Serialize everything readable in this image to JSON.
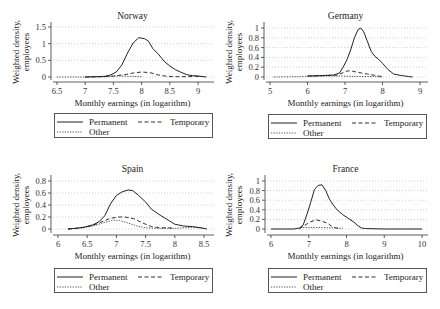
{
  "figure": {
    "layout": "2x2 grid of kernel density panels"
  },
  "chart_data": [
    {
      "type": "line",
      "title": "Norway",
      "xlabel": "Monthly earnings (in logarithm)",
      "ylabel": [
        "Weighted density,",
        "employees"
      ],
      "xticks": [
        6.5,
        7,
        7.5,
        8,
        8.5,
        9
      ],
      "xtick_labels": [
        "6.5",
        "7",
        "7.5",
        "8",
        "8.5",
        "9"
      ],
      "yticks": [
        0,
        0.5,
        1,
        1.5
      ],
      "ytick_labels": [
        "0",
        "0.5",
        "1",
        "1.5"
      ],
      "xlim": [
        6.4,
        9.27
      ],
      "ylim": [
        0,
        1.6
      ],
      "grid": true,
      "legend_position": "bottom",
      "series": [
        {
          "name": "Permanent",
          "style": "solid",
          "points": [
            [
              7.0,
              0
            ],
            [
              7.2,
              0.01
            ],
            [
              7.35,
              0.02
            ],
            [
              7.45,
              0.06
            ],
            [
              7.55,
              0.15
            ],
            [
              7.65,
              0.36
            ],
            [
              7.75,
              0.72
            ],
            [
              7.85,
              1.02
            ],
            [
              7.95,
              1.18
            ],
            [
              8.05,
              1.15
            ],
            [
              8.12,
              1.08
            ],
            [
              8.2,
              0.85
            ],
            [
              8.3,
              0.68
            ],
            [
              8.4,
              0.47
            ],
            [
              8.5,
              0.33
            ],
            [
              8.6,
              0.22
            ],
            [
              8.7,
              0.14
            ],
            [
              8.8,
              0.07
            ],
            [
              8.9,
              0.04
            ],
            [
              9.0,
              0.03
            ],
            [
              9.1,
              0.01
            ],
            [
              9.15,
              0
            ]
          ]
        },
        {
          "name": "Temporary",
          "style": "dash",
          "points": [
            [
              7.0,
              0
            ],
            [
              7.3,
              0.01
            ],
            [
              7.5,
              0.03
            ],
            [
              7.7,
              0.07
            ],
            [
              7.85,
              0.12
            ],
            [
              8.0,
              0.15
            ],
            [
              8.15,
              0.13
            ],
            [
              8.3,
              0.06
            ],
            [
              8.45,
              0.02
            ],
            [
              8.6,
              0.01
            ],
            [
              8.8,
              0.01
            ],
            [
              9.0,
              0.02
            ],
            [
              9.1,
              0.01
            ]
          ]
        },
        {
          "name": "Other",
          "style": "dot",
          "points": [
            [
              6.5,
              0
            ],
            [
              7.0,
              0
            ],
            [
              7.4,
              0.01
            ],
            [
              7.6,
              0.03
            ],
            [
              7.8,
              0.02
            ],
            [
              8.0,
              0.01
            ]
          ]
        }
      ]
    },
    {
      "type": "line",
      "title": "Germany",
      "xlabel": "Monthly earnings (in logarithm)",
      "ylabel": [
        "Weighted density,",
        "employees"
      ],
      "xticks": [
        5,
        6,
        7,
        8,
        9
      ],
      "xtick_labels": [
        "5",
        "6",
        "7",
        "8",
        "9"
      ],
      "yticks": [
        0,
        0.2,
        0.4,
        0.6,
        0.8,
        1
      ],
      "ytick_labels": [
        "0",
        "0.2",
        "0.4",
        "0.6",
        "0.8",
        "1"
      ],
      "xlim": [
        4.85,
        9.2
      ],
      "ylim": [
        0,
        1.05
      ],
      "grid": true,
      "legend_position": "bottom",
      "series": [
        {
          "name": "Permanent",
          "style": "solid",
          "points": [
            [
              6.0,
              0.02
            ],
            [
              6.4,
              0.03
            ],
            [
              6.7,
              0.04
            ],
            [
              6.85,
              0.08
            ],
            [
              6.95,
              0.2
            ],
            [
              7.05,
              0.35
            ],
            [
              7.15,
              0.55
            ],
            [
              7.25,
              0.8
            ],
            [
              7.35,
              0.97
            ],
            [
              7.42,
              1.0
            ],
            [
              7.5,
              0.92
            ],
            [
              7.6,
              0.72
            ],
            [
              7.7,
              0.52
            ],
            [
              7.8,
              0.42
            ],
            [
              7.9,
              0.36
            ],
            [
              8.0,
              0.28
            ],
            [
              8.15,
              0.15
            ],
            [
              8.3,
              0.06
            ],
            [
              8.5,
              0.03
            ],
            [
              8.7,
              0.01
            ],
            [
              8.8,
              0
            ]
          ]
        },
        {
          "name": "Temporary",
          "style": "dash",
          "points": [
            [
              6.0,
              0.02
            ],
            [
              6.5,
              0.03
            ],
            [
              6.8,
              0.04
            ],
            [
              6.95,
              0.09
            ],
            [
              7.05,
              0.12
            ],
            [
              7.15,
              0.13
            ],
            [
              7.3,
              0.1
            ],
            [
              7.45,
              0.08
            ],
            [
              7.6,
              0.06
            ],
            [
              7.75,
              0.04
            ],
            [
              7.9,
              0.02
            ],
            [
              8.0,
              0.01
            ]
          ]
        },
        {
          "name": "Other",
          "style": "dot",
          "points": [
            [
              5.1,
              0
            ],
            [
              6.0,
              0.01
            ],
            [
              6.5,
              0.02
            ],
            [
              6.9,
              0.02
            ],
            [
              7.3,
              0.01
            ],
            [
              7.7,
              0.01
            ],
            [
              8.0,
              0
            ]
          ]
        }
      ]
    },
    {
      "type": "line",
      "title": "Spain",
      "xlabel": "Monthly earnings (in logarithm)",
      "ylabel": [
        "Weighted density,",
        "employees"
      ],
      "xticks": [
        6,
        6.5,
        7,
        7.5,
        8,
        8.5
      ],
      "xtick_labels": [
        "6",
        "6.5",
        "7",
        "7.5",
        "8",
        "8.5"
      ],
      "yticks": [
        0,
        0.2,
        0.4,
        0.6,
        0.8
      ],
      "ytick_labels": [
        "0",
        "0.2",
        "0.4",
        "0.6",
        "0.8"
      ],
      "xlim": [
        5.9,
        8.6
      ],
      "ylim": [
        0,
        0.85
      ],
      "grid": true,
      "legend_position": "bottom",
      "series": [
        {
          "name": "Permanent",
          "style": "solid",
          "points": [
            [
              6.17,
              0
            ],
            [
              6.3,
              0.01
            ],
            [
              6.45,
              0.03
            ],
            [
              6.6,
              0.07
            ],
            [
              6.7,
              0.12
            ],
            [
              6.8,
              0.22
            ],
            [
              6.9,
              0.42
            ],
            [
              7.0,
              0.56
            ],
            [
              7.1,
              0.62
            ],
            [
              7.2,
              0.65
            ],
            [
              7.28,
              0.64
            ],
            [
              7.38,
              0.56
            ],
            [
              7.5,
              0.45
            ],
            [
              7.6,
              0.33
            ],
            [
              7.75,
              0.23
            ],
            [
              7.9,
              0.14
            ],
            [
              8.0,
              0.08
            ],
            [
              8.15,
              0.05
            ],
            [
              8.3,
              0.04
            ],
            [
              8.45,
              0.02
            ],
            [
              8.55,
              0
            ]
          ]
        },
        {
          "name": "Temporary",
          "style": "dash",
          "points": [
            [
              6.17,
              0
            ],
            [
              6.4,
              0.02
            ],
            [
              6.6,
              0.06
            ],
            [
              6.75,
              0.12
            ],
            [
              6.9,
              0.18
            ],
            [
              7.05,
              0.2
            ],
            [
              7.15,
              0.2
            ],
            [
              7.3,
              0.17
            ],
            [
              7.45,
              0.1
            ],
            [
              7.6,
              0.04
            ],
            [
              7.75,
              0.02
            ],
            [
              7.9,
              0.02
            ],
            [
              8.0,
              0.01
            ]
          ]
        },
        {
          "name": "Other",
          "style": "dot",
          "points": [
            [
              6.17,
              0
            ],
            [
              6.4,
              0.02
            ],
            [
              6.6,
              0.05
            ],
            [
              6.8,
              0.11
            ],
            [
              6.95,
              0.15
            ],
            [
              7.05,
              0.14
            ],
            [
              7.2,
              0.1
            ],
            [
              7.35,
              0.05
            ],
            [
              7.5,
              0.02
            ],
            [
              7.7,
              0.01
            ],
            [
              8.0,
              0.01
            ],
            [
              8.3,
              0.03
            ],
            [
              8.5,
              0.01
            ]
          ]
        }
      ]
    },
    {
      "type": "line",
      "title": "France",
      "xlabel": "Monthly earnings (in logarithm)",
      "ylabel": [
        "Weighted density,",
        "employees"
      ],
      "xticks": [
        6,
        7,
        8,
        9,
        10
      ],
      "xtick_labels": [
        "6",
        "7",
        "8",
        "9",
        "10"
      ],
      "yticks": [
        0,
        0.2,
        0.4,
        0.6,
        0.8,
        1
      ],
      "ytick_labels": [
        "0",
        "0.2",
        "0.4",
        "0.6",
        "0.8",
        "1"
      ],
      "xlim": [
        5.85,
        10.15
      ],
      "ylim": [
        0,
        1.05
      ],
      "grid": true,
      "legend_position": "bottom",
      "series": [
        {
          "name": "Permanent",
          "style": "solid",
          "points": [
            [
              6.0,
              0
            ],
            [
              6.6,
              0
            ],
            [
              6.75,
              0.02
            ],
            [
              6.85,
              0.08
            ],
            [
              6.95,
              0.3
            ],
            [
              7.05,
              0.55
            ],
            [
              7.15,
              0.82
            ],
            [
              7.25,
              0.91
            ],
            [
              7.35,
              0.92
            ],
            [
              7.45,
              0.8
            ],
            [
              7.55,
              0.62
            ],
            [
              7.65,
              0.5
            ],
            [
              7.75,
              0.4
            ],
            [
              7.9,
              0.3
            ],
            [
              8.05,
              0.22
            ],
            [
              8.2,
              0.14
            ],
            [
              8.3,
              0.07
            ],
            [
              8.4,
              0.02
            ],
            [
              8.5,
              0.01
            ],
            [
              9.0,
              0
            ],
            [
              10.0,
              0
            ]
          ]
        },
        {
          "name": "Temporary",
          "style": "dash",
          "points": [
            [
              6.75,
              0
            ],
            [
              6.9,
              0.08
            ],
            [
              7.05,
              0.15
            ],
            [
              7.2,
              0.19
            ],
            [
              7.35,
              0.16
            ],
            [
              7.5,
              0.12
            ],
            [
              7.6,
              0.06
            ],
            [
              7.7,
              0.03
            ],
            [
              7.8,
              0.01
            ]
          ]
        },
        {
          "name": "Other",
          "style": "dot",
          "points": [
            [
              6.85,
              0.03
            ],
            [
              7.1,
              0.03
            ],
            [
              7.4,
              0.03
            ],
            [
              7.7,
              0.02
            ],
            [
              7.9,
              0.01
            ]
          ]
        }
      ]
    }
  ]
}
